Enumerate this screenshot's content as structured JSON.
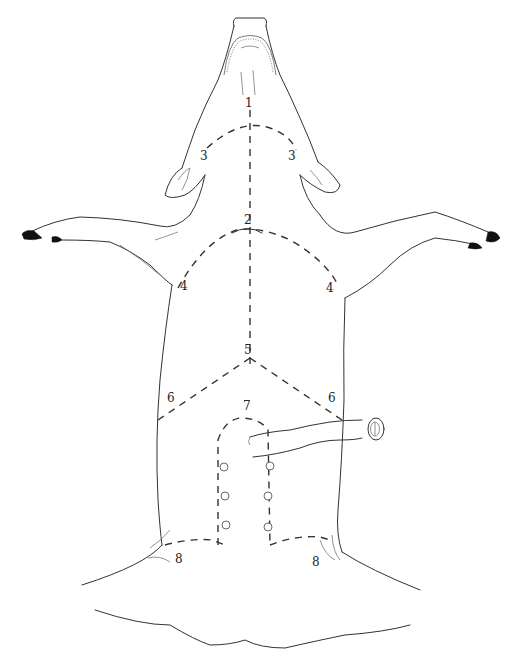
{
  "figure": {
    "line_color": "#333333",
    "background": "#ffffff"
  },
  "labels": {
    "l1": "1",
    "l2": "2",
    "l3_left": "3",
    "l3_right": "3",
    "l4_left": "4",
    "l4_right": "4",
    "l5": "5",
    "l6_left": "6",
    "l6_right": "6",
    "l7": "7",
    "l8_left": "8",
    "l8_right": "8"
  }
}
